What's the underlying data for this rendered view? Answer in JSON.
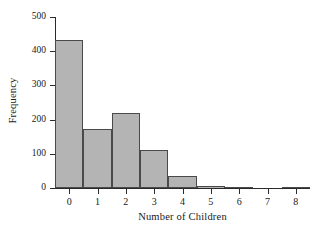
{
  "chart_data": {
    "type": "bar",
    "title": "",
    "subtitle": "",
    "xlabel": "Number of Children",
    "ylabel": "Frequency",
    "categories": [
      "0",
      "1",
      "2",
      "3",
      "4",
      "5",
      "6",
      "7",
      "8"
    ],
    "values": [
      433,
      172,
      220,
      111,
      35,
      7,
      4,
      0,
      2
    ],
    "xlim": [
      -0.5,
      8.5
    ],
    "ylim": [
      0,
      500
    ],
    "y_ticks": [
      0,
      100,
      200,
      300,
      400,
      500
    ],
    "x_ticks": [
      "0",
      "1",
      "2",
      "3",
      "4",
      "5",
      "6",
      "7",
      "8"
    ],
    "grid": false,
    "legend": null,
    "bar_fill_color": "#b4b4b4",
    "bar_edge_color": "#4a4a4a",
    "axis_color": "#2b2b2b",
    "background_color": "#ffffff"
  },
  "axes": {
    "y_tick_labels": [
      "0",
      "100",
      "200",
      "300",
      "400",
      "500"
    ],
    "x_tick_labels": [
      "0",
      "1",
      "2",
      "3",
      "4",
      "5",
      "6",
      "7",
      "8"
    ],
    "x_title": "Number of Children",
    "y_title": "Frequency"
  }
}
